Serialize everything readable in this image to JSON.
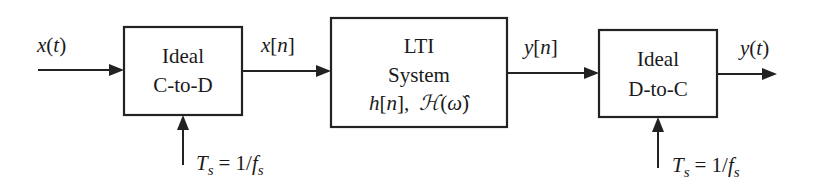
{
  "diagram": {
    "type": "block-diagram",
    "title": "",
    "blocks": [
      {
        "id": "c2d",
        "lines": [
          "Ideal",
          "C-to-D"
        ]
      },
      {
        "id": "lti",
        "lines": [
          "LTI",
          "System"
        ],
        "math": {
          "h": "h",
          "n": "n",
          "sep": ",",
          "H": "ℋ",
          "omega": "ω̂"
        }
      },
      {
        "id": "d2c",
        "lines": [
          "Ideal",
          "D-to-C"
        ]
      }
    ],
    "signals": {
      "input": {
        "fn": "x",
        "arg": "t",
        "style": "paren"
      },
      "x_n": {
        "fn": "x",
        "arg": "n",
        "style": "bracket"
      },
      "y_n": {
        "fn": "y",
        "arg": "n",
        "style": "bracket"
      },
      "output": {
        "fn": "y",
        "arg": "t",
        "style": "paren"
      }
    },
    "clock": {
      "T": "T",
      "sub": "s",
      "eq": "= 1/",
      "f": "f",
      "fsub": "s"
    },
    "connections": [
      {
        "from": "input",
        "to": "c2d",
        "label": "x(t)"
      },
      {
        "from": "c2d",
        "to": "lti",
        "label": "x[n]"
      },
      {
        "from": "lti",
        "to": "d2c",
        "label": "y[n]"
      },
      {
        "from": "d2c",
        "to": "output",
        "label": "y(t)"
      },
      {
        "from": "clock-1",
        "to": "c2d",
        "label": "Ts = 1/fs"
      },
      {
        "from": "clock-2",
        "to": "d2c",
        "label": "Ts = 1/fs"
      }
    ]
  }
}
